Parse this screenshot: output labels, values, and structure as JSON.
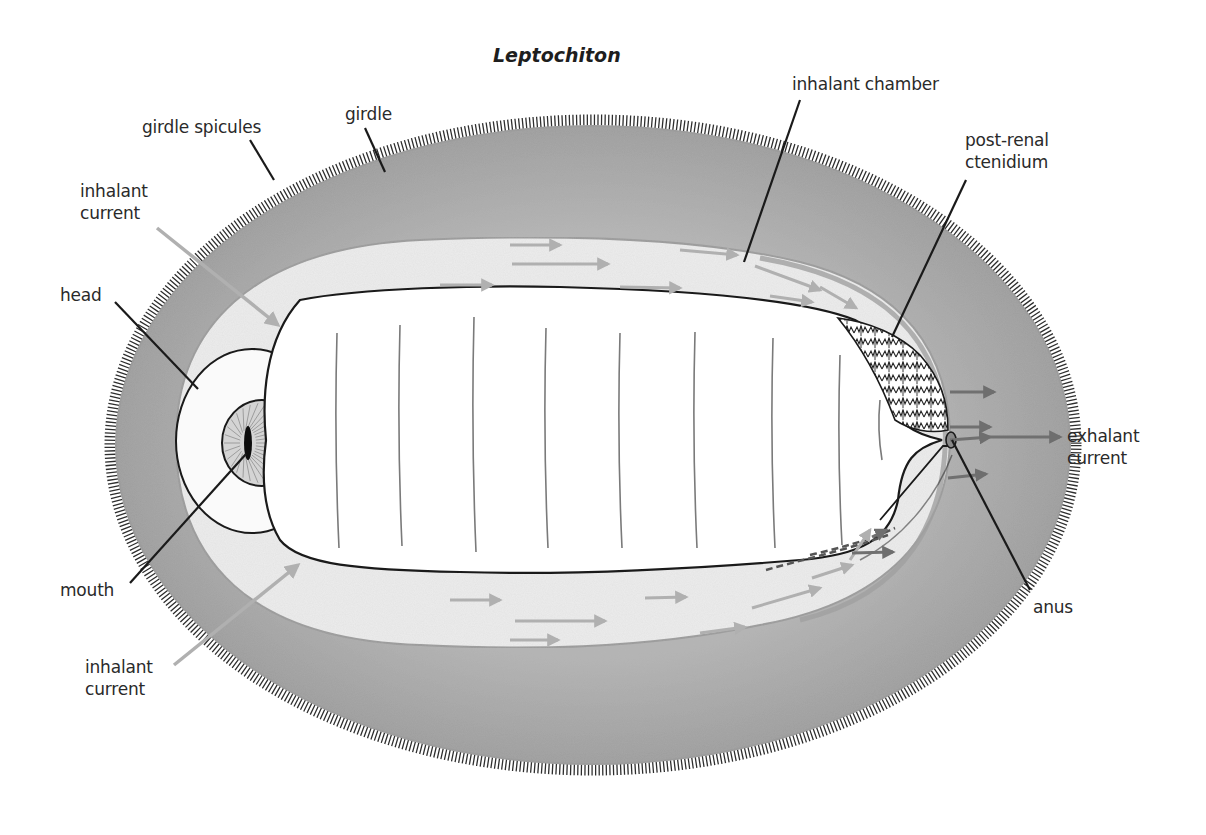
{
  "diagram": {
    "title": "Leptochiton",
    "colors": {
      "girdle": "#a9a9a9",
      "girdle_dark": "#9a9a9a",
      "chamber": "#ececec",
      "foot": "#ffffff",
      "outline": "#1a1a1a",
      "inhalant_arrow": "#b0b0b0",
      "exhalant_arrow": "#707070",
      "leader": "#1a1a1a",
      "spicule": "#333333"
    },
    "labels": [
      {
        "id": "girdle",
        "text": "girdle",
        "x": 345,
        "y": 103
      },
      {
        "id": "girdle-spicules",
        "text": "girdle spicules",
        "x": 142,
        "y": 116
      },
      {
        "id": "inhalant-current-top",
        "text": "inhalant\ncurrent",
        "x": 80,
        "y": 180
      },
      {
        "id": "head",
        "text": "head",
        "x": 60,
        "y": 284
      },
      {
        "id": "mouth",
        "text": "mouth",
        "x": 60,
        "y": 579
      },
      {
        "id": "inhalant-current-bottom",
        "text": "inhalant\ncurrent",
        "x": 85,
        "y": 656
      },
      {
        "id": "inhalant-chamber",
        "text": "inhalant chamber",
        "x": 792,
        "y": 73
      },
      {
        "id": "post-renal-ctenidium",
        "text": "post-renal\nctenidium",
        "x": 965,
        "y": 129
      },
      {
        "id": "exhalant-current",
        "text": "exhalant\ncurrent",
        "x": 1067,
        "y": 425
      },
      {
        "id": "anus",
        "text": "anus",
        "x": 1033,
        "y": 596
      }
    ],
    "leaders": [
      {
        "for": "girdle",
        "x1": 365,
        "y1": 128,
        "x2": 385,
        "y2": 172
      },
      {
        "for": "girdle-spicules",
        "x1": 250,
        "y1": 140,
        "x2": 274,
        "y2": 180
      },
      {
        "for": "head",
        "x1": 115,
        "y1": 302,
        "x2": 198,
        "y2": 389
      },
      {
        "for": "mouth",
        "x1": 130,
        "y1": 583,
        "x2": 246,
        "y2": 454
      },
      {
        "for": "inhalant-chamber",
        "x1": 800,
        "y1": 100,
        "x2": 744,
        "y2": 262
      },
      {
        "for": "post-renal-ctenidium",
        "x1": 966,
        "y1": 180,
        "x2": 892,
        "y2": 337
      },
      {
        "for": "anus",
        "x1": 1030,
        "y1": 590,
        "x2": 952,
        "y2": 440
      }
    ],
    "inhalant_pointers": [
      {
        "for": "inhalant-current-top",
        "x1": 157,
        "y1": 228,
        "x2": 278,
        "y2": 325
      },
      {
        "for": "inhalant-current-bottom",
        "x1": 174,
        "y1": 665,
        "x2": 298,
        "y2": 565
      }
    ],
    "flow_arrows": [
      {
        "x1": 510,
        "y1": 245,
        "x2": 560,
        "y2": 245
      },
      {
        "x1": 512,
        "y1": 264,
        "x2": 608,
        "y2": 264
      },
      {
        "x1": 440,
        "y1": 285,
        "x2": 492,
        "y2": 285
      },
      {
        "x1": 620,
        "y1": 287,
        "x2": 680,
        "y2": 288
      },
      {
        "x1": 680,
        "y1": 250,
        "x2": 737,
        "y2": 255
      },
      {
        "x1": 755,
        "y1": 266,
        "x2": 820,
        "y2": 290
      },
      {
        "x1": 770,
        "y1": 296,
        "x2": 812,
        "y2": 302
      },
      {
        "x1": 820,
        "y1": 287,
        "x2": 856,
        "y2": 308
      },
      {
        "x1": 450,
        "y1": 600,
        "x2": 500,
        "y2": 600
      },
      {
        "x1": 515,
        "y1": 621,
        "x2": 605,
        "y2": 621
      },
      {
        "x1": 510,
        "y1": 640,
        "x2": 558,
        "y2": 640
      },
      {
        "x1": 645,
        "y1": 598,
        "x2": 686,
        "y2": 597
      },
      {
        "x1": 700,
        "y1": 633,
        "x2": 745,
        "y2": 627
      },
      {
        "x1": 752,
        "y1": 608,
        "x2": 820,
        "y2": 588
      },
      {
        "x1": 812,
        "y1": 578,
        "x2": 852,
        "y2": 565
      },
      {
        "x1": 850,
        "y1": 560,
        "x2": 870,
        "y2": 530
      }
    ],
    "exhalant_arrows": [
      {
        "x1": 950,
        "y1": 392,
        "x2": 994,
        "y2": 392
      },
      {
        "x1": 950,
        "y1": 427,
        "x2": 990,
        "y2": 427
      },
      {
        "x1": 950,
        "y1": 440,
        "x2": 990,
        "y2": 437
      },
      {
        "x1": 990,
        "y1": 437,
        "x2": 1060,
        "y2": 437
      },
      {
        "x1": 948,
        "y1": 478,
        "x2": 986,
        "y2": 474
      },
      {
        "x1": 852,
        "y1": 553,
        "x2": 893,
        "y2": 552
      },
      {
        "x1": 872,
        "y1": 537,
        "x2": 886,
        "y2": 530
      }
    ],
    "foot_segments": [
      {
        "x": 337,
        "y1": 333,
        "y2": 548
      },
      {
        "x": 400,
        "y1": 325,
        "y2": 546
      },
      {
        "x": 474,
        "y1": 317,
        "y2": 552
      },
      {
        "x": 546,
        "y1": 328,
        "y2": 548
      },
      {
        "x": 620,
        "y1": 333,
        "y2": 548
      },
      {
        "x": 695,
        "y1": 332,
        "y2": 548
      },
      {
        "x": 773,
        "y1": 338,
        "y2": 548
      },
      {
        "x": 840,
        "y1": 355,
        "y2": 545
      },
      {
        "x": 880,
        "y1": 400,
        "y2": 460
      }
    ]
  }
}
